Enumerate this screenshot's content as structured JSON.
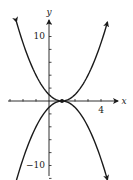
{
  "chart_data": {
    "type": "line",
    "title": "",
    "xlabel": "x",
    "ylabel": "y",
    "xlim": [
      -3.5,
      5.5
    ],
    "ylim": [
      -13,
      14
    ],
    "grid": false,
    "legend": null,
    "x_ticks": [
      -3,
      -2,
      -1,
      0,
      1,
      2,
      3,
      4
    ],
    "x_tick_labels": [
      {
        "value": 4,
        "label": "4"
      }
    ],
    "y_ticks": [
      -12,
      -10,
      -8,
      -6,
      -4,
      -2,
      0,
      2,
      4,
      6,
      8,
      10,
      12
    ],
    "y_tick_labels": [
      {
        "value": 10,
        "label": "10"
      },
      {
        "value": -10,
        "label": "−10"
      }
    ],
    "series": [
      {
        "name": "upward parabola",
        "equation": "y = (x - 1)^2",
        "x_range": [
          -2.5,
          4.5
        ],
        "arrows": "both ends",
        "points": [
          [
            -2.5,
            12.25
          ],
          [
            -2,
            9
          ],
          [
            -1,
            4
          ],
          [
            0,
            1
          ],
          [
            1,
            0
          ],
          [
            2,
            1
          ],
          [
            3,
            4
          ],
          [
            4,
            9
          ],
          [
            4.5,
            12.25
          ]
        ]
      },
      {
        "name": "downward parabola",
        "equation": "y = -(x - 1)^2",
        "x_range": [
          -2.5,
          4.5
        ],
        "arrows": "both ends",
        "points": [
          [
            -2.5,
            -12.25
          ],
          [
            -2,
            -9
          ],
          [
            -1,
            -4
          ],
          [
            0,
            -1
          ],
          [
            1,
            0
          ],
          [
            2,
            -1
          ],
          [
            3,
            -4
          ],
          [
            4,
            -9
          ],
          [
            4.5,
            -12.25
          ]
        ]
      }
    ],
    "annotations": [
      {
        "type": "point",
        "x": 1,
        "y": 0,
        "description": "tangent point where curves touch"
      }
    ]
  },
  "labels": {
    "x_axis": "x",
    "y_axis": "y",
    "x_tick_4": "4",
    "y_tick_10": "10",
    "y_tick_neg10": "−10"
  },
  "colors": {
    "ink": "#1a1a1a",
    "background": "#ffffff"
  }
}
